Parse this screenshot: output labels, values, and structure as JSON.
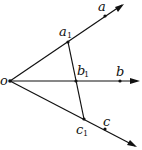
{
  "diagram": {
    "type": "geometry-rays",
    "stroke_color": "#111111",
    "background": "#ffffff",
    "origin": {
      "label": "o",
      "x": 10,
      "y": 81
    },
    "rays": [
      {
        "name": "ray-a",
        "end": {
          "x": 124,
          "y": 4
        }
      },
      {
        "name": "ray-b",
        "end": {
          "x": 139,
          "y": 81
        }
      },
      {
        "name": "ray-c",
        "end": {
          "x": 137,
          "y": 147
        }
      }
    ],
    "points": [
      {
        "name": "a1",
        "label": "a",
        "sub": "1",
        "x": 68,
        "y": 42
      },
      {
        "name": "a",
        "label": "a",
        "sub": "",
        "x": 105,
        "y": 16
      },
      {
        "name": "b1",
        "label": "b",
        "sub": "1",
        "x": 76,
        "y": 81
      },
      {
        "name": "b",
        "label": "b",
        "sub": "",
        "x": 120,
        "y": 81
      },
      {
        "name": "c1",
        "label": "c",
        "sub": "1",
        "x": 84,
        "y": 119
      },
      {
        "name": "c",
        "label": "c",
        "sub": "",
        "x": 105,
        "y": 129
      }
    ],
    "segment": {
      "from": "a1",
      "to": "c1",
      "through": "b1"
    }
  }
}
